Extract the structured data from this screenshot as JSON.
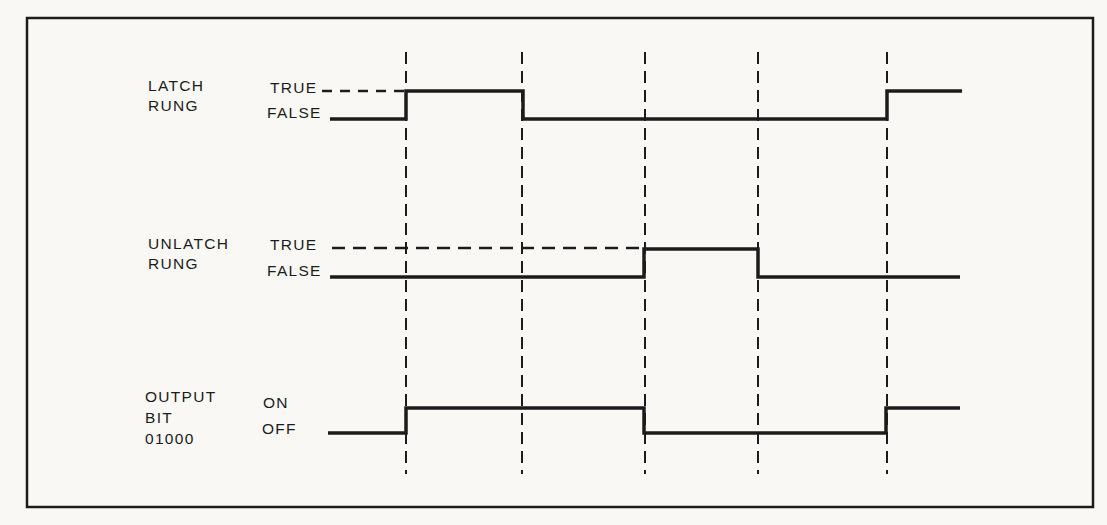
{
  "colors": {
    "paper": "#f9f8f5",
    "ink": "#1c1c1c"
  },
  "labels": {
    "latch": {
      "name": "LATCH\nRUNG",
      "high": "TRUE",
      "low": "FALSE"
    },
    "unlatch": {
      "name": "UNLATCH\nRUNG",
      "high": "TRUE",
      "low": "FALSE"
    },
    "output": {
      "name": "OUTPUT\nBIT\n01000",
      "high": "ON",
      "low": "OFF"
    }
  },
  "chart_data": {
    "type": "timing",
    "title": "",
    "time_markers": [
      1,
      2,
      3,
      4,
      5
    ],
    "signals": [
      {
        "name": "LATCH RUNG",
        "levels": [
          "FALSE",
          "TRUE"
        ],
        "initial": "FALSE",
        "transitions": [
          {
            "at_marker": 1,
            "to": "TRUE"
          },
          {
            "at_marker": 2,
            "to": "FALSE"
          },
          {
            "at_marker": 5,
            "to": "TRUE"
          }
        ]
      },
      {
        "name": "UNLATCH RUNG",
        "levels": [
          "FALSE",
          "TRUE"
        ],
        "initial": "FALSE",
        "transitions": [
          {
            "at_marker": 3,
            "to": "TRUE"
          },
          {
            "at_marker": 4,
            "to": "FALSE"
          }
        ]
      },
      {
        "name": "OUTPUT BIT 01000",
        "levels": [
          "OFF",
          "ON"
        ],
        "initial": "OFF",
        "transitions": [
          {
            "at_marker": 1,
            "to": "ON"
          },
          {
            "at_marker": 3,
            "to": "OFF"
          },
          {
            "at_marker": 5,
            "to": "ON"
          }
        ]
      }
    ]
  },
  "geometry": {
    "canvas": {
      "width": 1107,
      "height": 525
    },
    "frame": {
      "x": 27,
      "y": 18,
      "width": 1066,
      "height": 489
    },
    "marker_lines": {
      "x": [
        406,
        522,
        645,
        758,
        887
      ],
      "y1": 52,
      "y2": 474,
      "dash": "12 7",
      "width": 2
    },
    "leaders": [
      {
        "name": "latch-true-leader",
        "x1": 322,
        "y1": 91,
        "x2": 404,
        "y2": 91,
        "dash": "10 8"
      },
      {
        "name": "unlatch-true-leader",
        "x1": 332,
        "y1": 248,
        "x2": 642,
        "y2": 248,
        "dash": "13 8"
      }
    ],
    "waveforms": [
      {
        "name": "latch-rung",
        "points": [
          [
            330,
            119
          ],
          [
            406,
            119
          ],
          [
            406,
            91
          ],
          [
            523,
            91
          ],
          [
            523,
            119
          ],
          [
            887,
            119
          ],
          [
            887,
            91
          ],
          [
            962,
            91
          ]
        ]
      },
      {
        "name": "unlatch-rung",
        "points": [
          [
            330,
            277
          ],
          [
            644,
            277
          ],
          [
            644,
            249
          ],
          [
            758,
            249
          ],
          [
            758,
            277
          ],
          [
            960,
            277
          ]
        ]
      },
      {
        "name": "output-bit",
        "points": [
          [
            328,
            433
          ],
          [
            406,
            433
          ],
          [
            406,
            408
          ],
          [
            644,
            408
          ],
          [
            644,
            433
          ],
          [
            886,
            433
          ],
          [
            886,
            408
          ],
          [
            960,
            408
          ]
        ]
      }
    ],
    "stroke": {
      "wave_width": 3.5,
      "frame_width": 2.5,
      "leader_width": 2.5
    }
  }
}
